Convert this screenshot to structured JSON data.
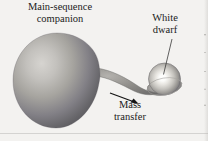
{
  "figure": {
    "background_color": "#f3f2f0",
    "width": 208,
    "height": 141
  },
  "labels": {
    "companion": {
      "line1": "Main-sequence",
      "line2": "companion",
      "color": "#1b1b1b"
    },
    "white_dwarf": {
      "line1": "White",
      "line2": "dwarf",
      "color": "#1b1b1b"
    },
    "mass_transfer": {
      "line1": "Mass",
      "line2": "transfer",
      "color": "#1b1b1b"
    }
  },
  "objects": {
    "companion_star": {
      "name": "Main-sequence companion",
      "shape": "roche-lobe teardrop",
      "fill_light": "#cfcdc9",
      "fill_mid": "#9b9994",
      "fill_dark": "#57565a"
    },
    "white_dwarf": {
      "name": "White dwarf",
      "shape": "sphere with accretion ring",
      "core_color": "#fdfdfb",
      "mid_color": "#c9c7c2",
      "rim_color": "#6d6c6b"
    },
    "mass_stream": {
      "name": "Mass transfer stream",
      "color": "#7e7d7b"
    },
    "arrow": {
      "name": "Mass transfer direction arrow",
      "color": "#141414",
      "direction": "down-right"
    },
    "leader_line": {
      "name": "White dwarf leader line",
      "color": "#3a3a3a"
    }
  }
}
